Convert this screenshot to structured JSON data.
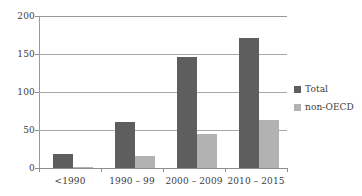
{
  "chart_data": {
    "type": "bar",
    "title": "",
    "xlabel": "",
    "ylabel": "",
    "ylim": [
      0,
      200
    ],
    "yticks": [
      0,
      50,
      100,
      150,
      200
    ],
    "grid": true,
    "legend_position": "right",
    "categories": [
      "<1990",
      "1990 – 99",
      "2000 – 2009",
      "2010 – 2015"
    ],
    "series": [
      {
        "name": "Total",
        "color": "#5e5e5e",
        "values": [
          19,
          60,
          146,
          171
        ]
      },
      {
        "name": "non-OECD",
        "color": "#b2b2b2",
        "values": [
          1,
          16,
          45,
          63
        ]
      }
    ]
  },
  "axis": {
    "y_tick_labels": [
      "200",
      "150",
      "100",
      "50",
      "0"
    ]
  },
  "legend": {
    "items": [
      {
        "label": "Total",
        "swatch": "legend-swatch-total"
      },
      {
        "label": "non-OECD",
        "swatch": "legend-swatch-non-oecd"
      }
    ]
  }
}
